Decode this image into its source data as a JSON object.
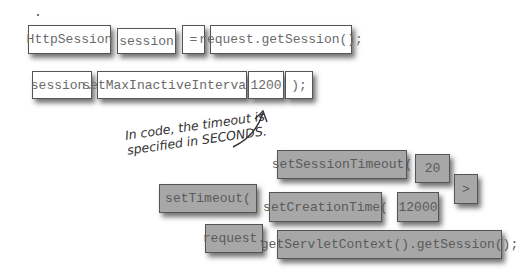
{
  "statement1": {
    "tiles": [
      "HttpSession",
      "session",
      "=",
      "request.getSession();"
    ]
  },
  "statement2": {
    "tiles": [
      "session.",
      "setMaxInactiveInterval(",
      "1200",
      ");"
    ]
  },
  "annotation": {
    "line1": "In code, the timeout is",
    "line2": "specified in SECONDS."
  },
  "unused_tiles": {
    "set_session_timeout": "setSessionTimeout(",
    "twenty": "20",
    "greater_than": ">",
    "set_timeout": "setTimeout(",
    "set_creation_time": "setCreationTime(",
    "twelve_thousand": "12000",
    "request": "request.",
    "get_servlet_context": "getServletContext().getSession();"
  },
  "colors": {
    "placed_tile": "#ffffff",
    "unused_tile": "#a7a7a7"
  }
}
